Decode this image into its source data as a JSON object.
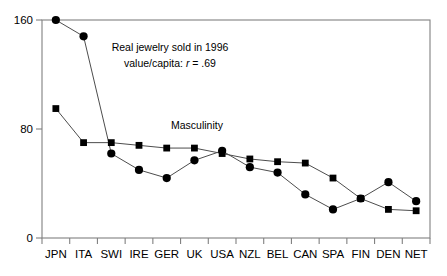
{
  "chart_data": {
    "type": "line",
    "title": "",
    "xlabel": "",
    "ylabel": "",
    "ylim": [
      0,
      160
    ],
    "yticks": [
      0,
      80,
      160
    ],
    "ytick_labels": [
      "0",
      "80",
      "160"
    ],
    "grid": false,
    "legend_position": "inline-annotation",
    "categories": [
      "JPN",
      "ITA",
      "SWI",
      "IRE",
      "GER",
      "UK",
      "USA",
      "NZL",
      "BEL",
      "CAN",
      "SPA",
      "FIN",
      "DEN",
      "NET"
    ],
    "series": [
      {
        "name": "Real jewelry sold in 1996 value/capita",
        "marker": "circle",
        "values": [
          160,
          148,
          62,
          50,
          44,
          57,
          64,
          52,
          48,
          32,
          21,
          29,
          41,
          27
        ]
      },
      {
        "name": "Masculinity",
        "marker": "square",
        "values": [
          95,
          70,
          70,
          68,
          66,
          66,
          62,
          58,
          56,
          55,
          44,
          29,
          21,
          20
        ]
      }
    ],
    "annotations": [
      {
        "name": "jewelry-annotation",
        "line1": "Real jewelry sold in 1996",
        "line2_prefix": "value/capita: ",
        "line2_italic": "r",
        "line2_suffix": " = .69"
      },
      {
        "name": "masculinity-annotation",
        "text": "Masculinity"
      }
    ],
    "colors": {
      "marker": "#000000",
      "line": "#4d4d4d",
      "axis": "#808080",
      "background": "#ffffff"
    }
  }
}
